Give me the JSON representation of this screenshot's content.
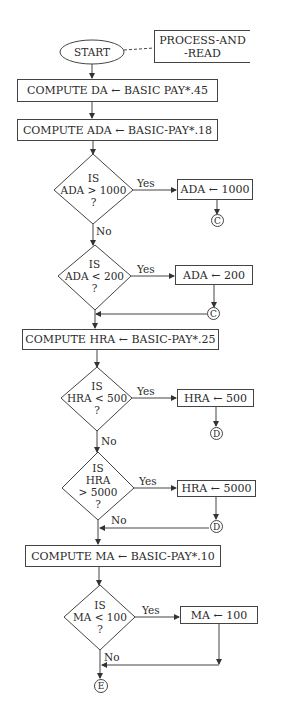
{
  "flowchart": {
    "start": {
      "label": "START"
    },
    "annotation": {
      "line1": "PROCESS-AND",
      "line2": "-READ"
    },
    "process": [
      {
        "id": "da",
        "label": "COMPUTE DA ← BASIC PAY*.45"
      },
      {
        "id": "ada",
        "label": "COMPUTE ADA ← BASIC-PAY*.18"
      },
      {
        "id": "hra",
        "label": "COMPUTE HRA ← BASIC-PAY*.25"
      },
      {
        "id": "ma",
        "label": "COMPUTE MA ← BASIC-PAY*.10"
      }
    ],
    "decisions": [
      {
        "id": "d1",
        "line1": "IS",
        "line2": "ADA > 1000",
        "line3": "?",
        "yes": "Yes",
        "no": "No",
        "action": "ADA ← 1000",
        "connector": "C"
      },
      {
        "id": "d2",
        "line1": "IS",
        "line2": "ADA < 200",
        "line3": "?",
        "yes": "Yes",
        "action": "ADA ← 200",
        "connector": "C"
      },
      {
        "id": "d3",
        "line1": "IS",
        "line2": "HRA < 500",
        "line3": "?",
        "yes": "Yes",
        "no": "No",
        "action": "HRA ← 500",
        "connector": "D"
      },
      {
        "id": "d4",
        "line1": "IS",
        "line2": "HRA",
        "line3": "> 5000",
        "line4": "?",
        "yes": "Yes",
        "no": "No",
        "action": "HRA ← 5000",
        "connector": "D"
      },
      {
        "id": "d5",
        "line1": "IS",
        "line2": "MA < 100",
        "line3": "?",
        "yes": "Yes",
        "no": "No",
        "action": "MA ← 100"
      }
    ],
    "end_connector": "E"
  }
}
